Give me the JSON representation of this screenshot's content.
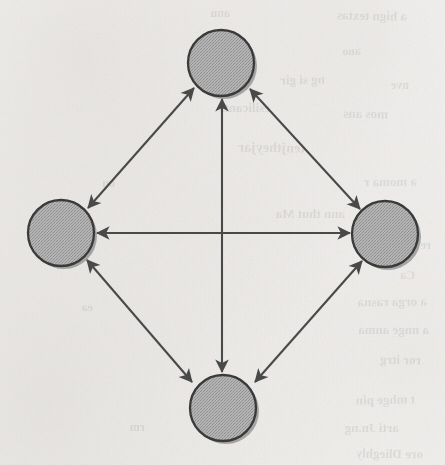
{
  "page": {
    "width": 445,
    "height": 465,
    "background_color": "#fcfbfa",
    "media": "scanned book page with reverse-side bleed-through"
  },
  "palette": {
    "node_fill": "#a9a9a9",
    "node_stroke": "#3a3a3a",
    "node_shadow": "#6e6e6e",
    "edge_stroke": "#4a4a4a",
    "paper": "#fcfbfa",
    "bleed_text": "#2b2622"
  },
  "chart_data": {
    "type": "diagram",
    "graph_type": "complete-graph-K4",
    "title": "",
    "xlabel": "",
    "ylabel": "",
    "directed": false,
    "bidirectional_arrows": true,
    "node_count": 4,
    "edge_count": 6,
    "layout": "diamond",
    "nodes": [
      {
        "id": "top",
        "label": "",
        "cx": 221,
        "cy": 63,
        "r": 33
      },
      {
        "id": "left",
        "label": "",
        "cx": 61,
        "cy": 233,
        "r": 33
      },
      {
        "id": "right",
        "label": "",
        "cx": 385,
        "cy": 234,
        "r": 33
      },
      {
        "id": "bottom",
        "label": "",
        "cx": 223,
        "cy": 408,
        "r": 33
      }
    ],
    "edges": [
      {
        "id": "edge-left-top",
        "from": "left",
        "to": "top",
        "arrowheads": "both",
        "orientation": "diagonal"
      },
      {
        "id": "edge-top-right",
        "from": "top",
        "to": "right",
        "arrowheads": "both",
        "orientation": "diagonal"
      },
      {
        "id": "edge-left-right",
        "from": "left",
        "to": "right",
        "arrowheads": "both",
        "orientation": "horizontal"
      },
      {
        "id": "edge-top-bottom",
        "from": "top",
        "to": "bottom",
        "arrowheads": "both",
        "orientation": "vertical"
      },
      {
        "id": "edge-left-bottom",
        "from": "left",
        "to": "bottom",
        "arrowheads": "both",
        "orientation": "diagonal"
      },
      {
        "id": "edge-bottom-right",
        "from": "bottom",
        "to": "right",
        "arrowheads": "both",
        "orientation": "diagonal"
      }
    ],
    "legend": [],
    "annotations": []
  },
  "bleed_through_text": [
    {
      "text": "a hign textas",
      "x": 38,
      "y": 8,
      "size": 13,
      "rot": -1
    },
    {
      "text": "anu",
      "x": 215,
      "y": 6,
      "size": 12,
      "rot": 0
    },
    {
      "text": "ano",
      "x": 84,
      "y": 44,
      "size": 12,
      "rot": 1
    },
    {
      "text": "the rar",
      "x": 196,
      "y": 38,
      "size": 13,
      "rot": -1
    },
    {
      "text": "nve",
      "x": 36,
      "y": 78,
      "size": 12,
      "rot": 0
    },
    {
      "text": "ng si gir",
      "x": 120,
      "y": 72,
      "size": 13,
      "rot": 1
    },
    {
      "text": "mos ans",
      "x": 57,
      "y": 106,
      "size": 13,
      "rot": -1
    },
    {
      "text": "esilicants",
      "x": 175,
      "y": 100,
      "size": 13,
      "rot": 0
    },
    {
      "text": "tenjtheyjar",
      "x": 140,
      "y": 140,
      "size": 14,
      "rot": -1
    },
    {
      "text": "a moma r",
      "x": 28,
      "y": 174,
      "size": 13,
      "rot": 1
    },
    {
      "text": "ann  thut  Ma",
      "x": 100,
      "y": 206,
      "size": 13,
      "rot": 0
    },
    {
      "text": "re",
      "x": 14,
      "y": 238,
      "size": 12,
      "rot": 0
    },
    {
      "text": "Ca",
      "x": 30,
      "y": 268,
      "size": 12,
      "rot": -1
    },
    {
      "text": "a  orga rasna",
      "x": 18,
      "y": 294,
      "size": 13,
      "rot": 1
    },
    {
      "text": "a   nnge  anma",
      "x": 16,
      "y": 322,
      "size": 13,
      "rot": 0
    },
    {
      "text": "ror itrg",
      "x": 24,
      "y": 352,
      "size": 13,
      "rot": -1
    },
    {
      "text": "t  mhge  pin",
      "x": 30,
      "y": 392,
      "size": 13,
      "rot": 1
    },
    {
      "text": "arti  Jn.ng",
      "x": 46,
      "y": 420,
      "size": 13,
      "rot": 0
    },
    {
      "text": "ore    Dlieghly",
      "x": 22,
      "y": 446,
      "size": 13,
      "rot": -1
    },
    {
      "text": "ou",
      "x": 330,
      "y": 176,
      "size": 12,
      "rot": 0
    },
    {
      "text": "ea",
      "x": 352,
      "y": 300,
      "size": 12,
      "rot": 1
    },
    {
      "text": "rm",
      "x": 300,
      "y": 420,
      "size": 12,
      "rot": 0
    }
  ]
}
